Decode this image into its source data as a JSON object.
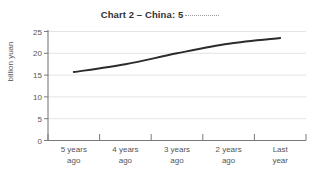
{
  "chart_data": {
    "type": "line",
    "title": "Chart 2 – China: 5",
    "title_trailing": "dotted-rule",
    "xlabel": "",
    "ylabel": "billion yuan",
    "categories": [
      "5 years\nago",
      "4 years\nago",
      "3 years\nago",
      "2 years\nago",
      "Last\nyear"
    ],
    "category_lines": [
      [
        "5 years",
        "ago"
      ],
      [
        "4 years",
        "ago"
      ],
      [
        "3 years",
        "ago"
      ],
      [
        "2 years",
        "ago"
      ],
      [
        "Last",
        "year"
      ]
    ],
    "values": [
      15.7,
      17.5,
      20.0,
      22.2,
      23.5
    ],
    "ylim": [
      0,
      25
    ],
    "yticks": [
      0,
      5,
      10,
      15,
      20,
      25
    ],
    "ytick_labels": [
      "0",
      "5",
      "10",
      "15",
      "20",
      "25"
    ],
    "grid": true,
    "grid_axis": "y",
    "legend": false,
    "series": [
      {
        "name": "China",
        "values": [
          15.7,
          17.5,
          20.0,
          22.2,
          23.5
        ],
        "color": "#2b2b2b"
      }
    ],
    "colors": {
      "line": "#2b2b2b",
      "grid": "#dcdcdc",
      "axis": "#7a7a7a",
      "text": "#555555",
      "title": "#333333",
      "background": "#ffffff"
    }
  }
}
